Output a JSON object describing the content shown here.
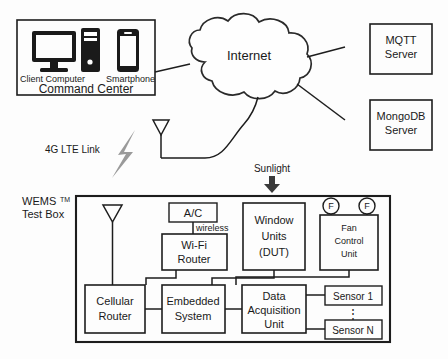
{
  "diagram": {
    "command_center": {
      "box_label": "Command Center",
      "devices": [
        {
          "name": "Client Computer",
          "icon": "desktop-computer-icon"
        },
        {
          "name": "Smartphone",
          "icon": "smartphone-icon"
        }
      ]
    },
    "cloud": {
      "label": "Internet",
      "icon": "cloud-shape"
    },
    "servers": [
      {
        "line1": "MQTT",
        "line2": "Server"
      },
      {
        "line1": "MongoDB",
        "line2": "Server"
      }
    ],
    "links": [
      {
        "label": "4G LTE Link",
        "icon": "lightning-bolt-icon"
      },
      {
        "label": "wireless"
      },
      {
        "label": "Sunlight",
        "icon": "down-arrow-icon"
      }
    ],
    "test_box": {
      "label_line1": "WEMS",
      "label_sup": "TM",
      "label_line2": "Test Box",
      "antenna_icon": "antenna-icon",
      "nodes": [
        {
          "id": "ac",
          "lines": [
            "A/C"
          ]
        },
        {
          "id": "wifi-router",
          "lines": [
            "Wi-Fi",
            "Router"
          ]
        },
        {
          "id": "window-units",
          "lines": [
            "Window",
            "Units",
            "(DUT)"
          ]
        },
        {
          "id": "fan-control-unit",
          "lines": [
            "Fan",
            "Control",
            "Unit"
          ]
        },
        {
          "id": "cellular-router",
          "lines": [
            "Cellular",
            "Router"
          ]
        },
        {
          "id": "embedded-system",
          "lines": [
            "Embedded",
            "System"
          ]
        },
        {
          "id": "data-acquisition-unit",
          "lines": [
            "Data",
            "Acquisition",
            "Unit"
          ]
        },
        {
          "id": "sensor-1",
          "lines": [
            "Sensor 1"
          ]
        },
        {
          "id": "sensor-n",
          "lines": [
            "Sensor N"
          ]
        }
      ],
      "fans": [
        {
          "label": "F"
        },
        {
          "label": "F"
        }
      ],
      "sensor_ellipsis": "⋮"
    },
    "external_antenna_icon": "antenna-icon"
  },
  "colors": {
    "ink": "#1a1a1a",
    "bolt": "#9a9a9a",
    "paper": "#fdfdfd"
  }
}
